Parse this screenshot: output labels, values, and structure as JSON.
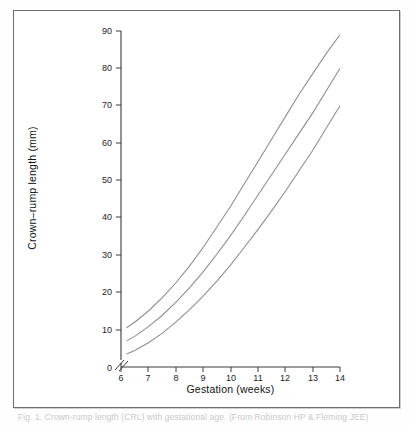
{
  "figure": {
    "caption": "Fig. 1. Crown-rump length (CRL) with gestational age. (From Robinson HP & Fleming JEE)"
  },
  "chart_data": {
    "type": "line",
    "title": "",
    "xlabel": "Gestation (weeks)",
    "ylabel": "Crown–rump length (mm)",
    "xlim": [
      6,
      14
    ],
    "ylim": [
      0,
      90
    ],
    "xticks": [
      6,
      7,
      8,
      9,
      10,
      11,
      12,
      13,
      14
    ],
    "yticks": [
      0,
      10,
      20,
      30,
      40,
      50,
      60,
      70,
      80,
      90
    ],
    "xticklabels": [
      "6",
      "7",
      "8",
      "9",
      "10",
      "11",
      "12",
      "13",
      "14"
    ],
    "yticklabels": [
      "0",
      "10",
      "20",
      "30",
      "40",
      "50",
      "60",
      "70",
      "80",
      "90"
    ],
    "grid": false,
    "legend": false,
    "axis_break": "y-axis broken between 0 and first data level",
    "line_color": "#8f8f8f",
    "axis_color": "#3a3a3a",
    "x": [
      6.2,
      6.5,
      7,
      7.5,
      8,
      8.5,
      9,
      9.5,
      10,
      10.5,
      11,
      11.5,
      12,
      12.5,
      13,
      13.5,
      14
    ],
    "series": [
      {
        "name": "upper limit",
        "values": [
          10.5,
          12.0,
          15.0,
          18.5,
          22.5,
          27.0,
          32.0,
          37.5,
          43.0,
          49.0,
          55.0,
          61.0,
          67.0,
          73.0,
          78.5,
          84.0,
          89.0
        ]
      },
      {
        "name": "mean",
        "values": [
          7.0,
          8.2,
          10.8,
          13.8,
          17.3,
          21.2,
          25.5,
          30.2,
          35.2,
          40.5,
          46.0,
          51.5,
          57.0,
          62.5,
          68.0,
          74.0,
          80.0
        ]
      },
      {
        "name": "lower limit",
        "values": [
          3.5,
          4.4,
          6.5,
          9.0,
          12.0,
          15.3,
          19.0,
          23.0,
          27.3,
          32.0,
          36.8,
          41.8,
          47.0,
          52.5,
          58.0,
          64.0,
          70.0
        ]
      }
    ]
  }
}
